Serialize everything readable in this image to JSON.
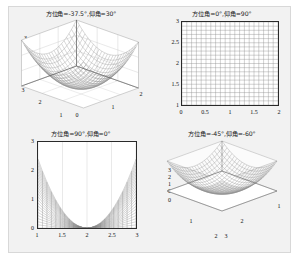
{
  "figure": {
    "background_color": "#f2f2f2",
    "axes_background_color": "#ffffff",
    "mesh_color": "#8a8a8a",
    "grid_color": "#bfbfbf"
  },
  "chart_data": [
    {
      "id": "top-left",
      "type": "surface",
      "title": "方位角=-37.5°,仰角=30°",
      "view": {
        "azimuth": -37.5,
        "elevation": 30
      },
      "surface_function": "z = (x-2)^2 + (y-2)^2  (paraboloid bowl)",
      "xlabel": "",
      "ylabel": "",
      "zlabel": "",
      "xlim": [
        0,
        2
      ],
      "ylim": [
        1,
        3
      ],
      "zlim": [
        0,
        3
      ],
      "xticks": [
        "0",
        "1",
        "2"
      ],
      "yticks": [
        "3",
        "2",
        "1"
      ],
      "zticks": [
        "0",
        "1",
        "2",
        "3"
      ],
      "grid": true,
      "mesh_lines_x": 20,
      "mesh_lines_y": 20
    },
    {
      "id": "top-right",
      "type": "surface",
      "title": "方位角=0°,仰角=90°",
      "view": {
        "azimuth": 0,
        "elevation": 90
      },
      "surface_function": "z = (x-2)^2 + (y-2)^2  (paraboloid bowl, viewed from directly above)",
      "xlabel": "",
      "ylabel": "",
      "xlim": [
        0,
        2
      ],
      "ylim": [
        1,
        3
      ],
      "xticks": [
        "0",
        "0.5",
        "1",
        "1.5",
        "2"
      ],
      "yticks": [
        "1",
        "1.5",
        "2",
        "2.5",
        "3"
      ],
      "grid": true,
      "mesh_lines_x": 20,
      "mesh_lines_y": 20
    },
    {
      "id": "bottom-left",
      "type": "surface",
      "title": "方位角=90°,仰角=0°",
      "view": {
        "azimuth": 90,
        "elevation": 0
      },
      "surface_function": "z = (x-2)^2 + (y-2)^2  (paraboloid bowl, viewed edge-on)",
      "xlabel": "",
      "ylabel": "",
      "xlim": [
        1,
        3
      ],
      "ylim": [
        0,
        3
      ],
      "xticks": [
        "1",
        "1.5",
        "2",
        "2.5",
        "3"
      ],
      "yticks": [
        "0",
        "1",
        "2",
        "3"
      ],
      "grid": true,
      "mesh_lines_x": 20,
      "mesh_lines_y": 20
    },
    {
      "id": "bottom-right",
      "type": "surface",
      "title": "方位角=-45°,仰角=-60°",
      "view": {
        "azimuth": -45,
        "elevation": -60
      },
      "surface_function": "z = (x-2)^2 + (y-2)^2  (paraboloid bowl, viewed from below)",
      "xlabel": "",
      "ylabel": "",
      "zlabel": "",
      "xlim": [
        2,
        3
      ],
      "ylim": [
        1,
        2
      ],
      "zlim": [
        0,
        3
      ],
      "xticks": [
        "2",
        "3"
      ],
      "yticks": [
        "1",
        "2"
      ],
      "zticks": [
        "0",
        "0",
        "1",
        "2",
        "3"
      ],
      "corner_ticks": [
        "2",
        "3"
      ],
      "right_tick": "1",
      "grid": true,
      "mesh_lines_x": 20,
      "mesh_lines_y": 20
    }
  ],
  "subplots": {
    "top_left": {
      "title": "方位角=-37.5°,仰角=30°",
      "z_ticks": [
        "3",
        "2",
        "1",
        "0"
      ],
      "left_ticks": [
        "3",
        "2",
        "1"
      ],
      "origin_tick": "0",
      "right_ticks": [
        "1",
        "2"
      ]
    },
    "top_right": {
      "title": "方位角=0°,仰角=90°",
      "y_ticks": [
        "3",
        "2.5",
        "2",
        "1.5",
        "1"
      ],
      "x_ticks": [
        "0",
        "0.5",
        "1",
        "1.5",
        "2"
      ]
    },
    "bottom_left": {
      "title": "方位角=90°,仰角=0°",
      "y_ticks": [
        "3",
        "2",
        "1",
        "0"
      ],
      "x_ticks": [
        "1",
        "1.5",
        "2",
        "2.5",
        "3"
      ]
    },
    "bottom_right": {
      "title": "方位角=-45°,仰角=-60°",
      "z_ticks": [
        "3",
        "2",
        "1",
        "0"
      ],
      "origin_tick": "0",
      "left_ticks": [
        "1",
        "2"
      ],
      "right_ticks": [
        "2",
        "1"
      ],
      "bottom_ticks": [
        "2",
        "3"
      ]
    }
  }
}
